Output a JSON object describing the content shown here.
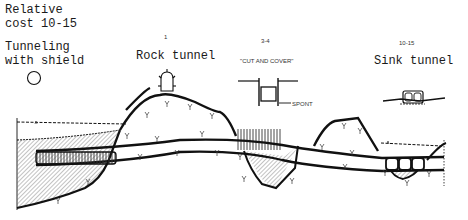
{
  "diagram": {
    "header": {
      "cost_label_line1": "Relative",
      "cost_label_line2": "cost 10-15"
    },
    "methods": [
      {
        "name_line1": "Tunneling",
        "name_line2": "with shield",
        "cost": "10-15",
        "icon": "circle-shield-icon"
      },
      {
        "name": "Rock tunnel",
        "cost": "1",
        "icon": "horseshoe-rock-tunnel-icon"
      },
      {
        "name": "\"CUT AND COVER\"",
        "cost": "3-4",
        "icon": "rectangular-trench-icon",
        "annotation": "SPONT"
      },
      {
        "name": "Sink tunnel",
        "cost": "10-15",
        "icon": "twin-box-sink-tunnel-icon"
      }
    ],
    "colors": {
      "ink": "#111111",
      "hatch": "#555555",
      "background": "#ffffff"
    }
  }
}
